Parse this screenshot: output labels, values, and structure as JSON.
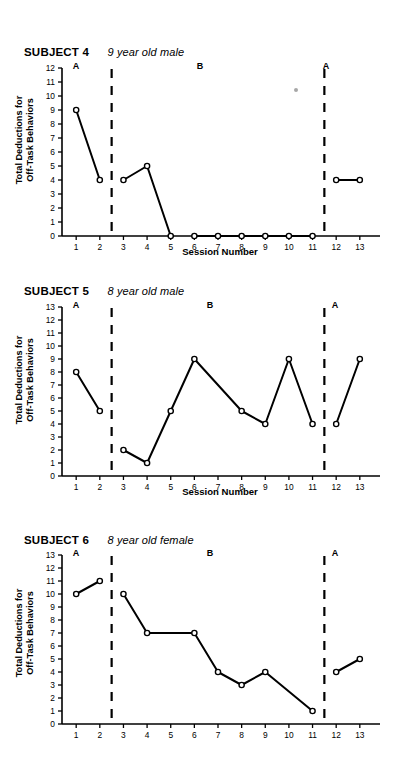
{
  "figure": {
    "panels": [
      {
        "subject_label": "SUBJECT 4",
        "description": "9 year old male",
        "ylabel_line1": "Total Deductions for",
        "ylabel_line2": "Off-Task Behaviors",
        "xlabel": "Session Number",
        "phase_labels": [
          "A",
          "B",
          "A"
        ],
        "chart_data": {
          "type": "line",
          "title": "SUBJECT 4 — 9 year old male",
          "xlabel": "Session Number",
          "ylabel": "Total Deductions for Off-Task Behaviors",
          "xlim": [
            0.4,
            13.6
          ],
          "ylim": [
            0,
            12
          ],
          "yticks": [
            0,
            1,
            2,
            3,
            4,
            5,
            6,
            7,
            8,
            9,
            10,
            11,
            12
          ],
          "xticks": [
            1,
            2,
            3,
            4,
            5,
            6,
            7,
            8,
            9,
            10,
            11,
            12,
            13
          ],
          "grid": false,
          "legend": "none",
          "phase_dividers": [
            2.5,
            11.5
          ],
          "phases": [
            {
              "label": "A",
              "x_center": 1.5
            },
            {
              "label": "B",
              "x_center": 7.0
            },
            {
              "label": "A",
              "x_center": 12.5
            }
          ],
          "segments": [
            {
              "phase": "A",
              "x": [
                1,
                2
              ],
              "y": [
                9,
                4
              ]
            },
            {
              "phase": "B",
              "x": [
                3,
                4,
                5
              ],
              "y": [
                4,
                5,
                0
              ]
            },
            {
              "phase": "B",
              "x": [
                6,
                7,
                8,
                9,
                10,
                11
              ],
              "y": [
                0,
                0,
                0,
                0,
                0,
                0
              ]
            },
            {
              "phase": "A",
              "x": [
                12,
                13
              ],
              "y": [
                4,
                4
              ]
            }
          ]
        }
      },
      {
        "subject_label": "SUBJECT 5",
        "description": "8 year old male",
        "ylabel_line1": "Total Deductions for",
        "ylabel_line2": "Off-Task Behaviors",
        "xlabel": "Session Number",
        "phase_labels": [
          "A",
          "B",
          "A"
        ],
        "chart_data": {
          "type": "line",
          "title": "SUBJECT 5 — 8 year old male",
          "xlabel": "Session Number",
          "ylabel": "Total Deductions for Off-Task Behaviors",
          "xlim": [
            0.4,
            13.6
          ],
          "ylim": [
            0,
            13
          ],
          "yticks": [
            0,
            1,
            2,
            3,
            4,
            5,
            6,
            7,
            8,
            9,
            10,
            11,
            12,
            13
          ],
          "xticks": [
            1,
            2,
            3,
            4,
            5,
            6,
            7,
            8,
            9,
            10,
            11,
            12,
            13
          ],
          "grid": false,
          "legend": "none",
          "phase_dividers": [
            2.5,
            11.5
          ],
          "phases": [
            {
              "label": "A",
              "x_center": 1.5
            },
            {
              "label": "B",
              "x_center": 7.0
            },
            {
              "label": "A",
              "x_center": 12.5
            }
          ],
          "segments": [
            {
              "phase": "A",
              "x": [
                1,
                2
              ],
              "y": [
                8,
                5
              ]
            },
            {
              "phase": "B",
              "x": [
                3,
                4,
                5,
                6,
                8,
                9,
                10,
                11
              ],
              "y": [
                2,
                1,
                5,
                9,
                5,
                4,
                9,
                4
              ]
            },
            {
              "phase": "A",
              "x": [
                12,
                13
              ],
              "y": [
                4,
                9
              ]
            }
          ]
        }
      },
      {
        "subject_label": "SUBJECT 6",
        "description": "8 year old female",
        "ylabel_line1": "Total Deductions for",
        "ylabel_line2": "Off-Task Behaviors",
        "xlabel": "",
        "phase_labels": [
          "A",
          "B",
          "A"
        ],
        "chart_data": {
          "type": "line",
          "title": "SUBJECT 6 — 8 year old female",
          "xlabel": "",
          "ylabel": "Total Deductions for Off-Task Behaviors",
          "xlim": [
            0.4,
            13.6
          ],
          "ylim": [
            0,
            13
          ],
          "yticks": [
            0,
            1,
            2,
            3,
            4,
            5,
            6,
            7,
            8,
            9,
            10,
            11,
            12,
            13
          ],
          "xticks": [
            1,
            2,
            3,
            4,
            5,
            6,
            7,
            8,
            9,
            10,
            11,
            12,
            13
          ],
          "grid": false,
          "legend": "none",
          "phase_dividers": [
            2.5,
            11.5
          ],
          "phases": [
            {
              "label": "A",
              "x_center": 1.5
            },
            {
              "label": "B",
              "x_center": 7.0
            },
            {
              "label": "A",
              "x_center": 12.5
            }
          ],
          "segments": [
            {
              "phase": "A",
              "x": [
                1,
                2
              ],
              "y": [
                10,
                11
              ]
            },
            {
              "phase": "B",
              "x": [
                3,
                4,
                6,
                7,
                8,
                9,
                11
              ],
              "y": [
                10,
                7,
                7,
                4,
                3,
                4,
                1
              ]
            },
            {
              "phase": "A",
              "x": [
                12,
                13
              ],
              "y": [
                4,
                5
              ]
            }
          ]
        }
      }
    ],
    "colors": {
      "line": "#000000",
      "marker_fill": "#ffffff",
      "axis": "#000000",
      "background": "#ffffff"
    }
  }
}
